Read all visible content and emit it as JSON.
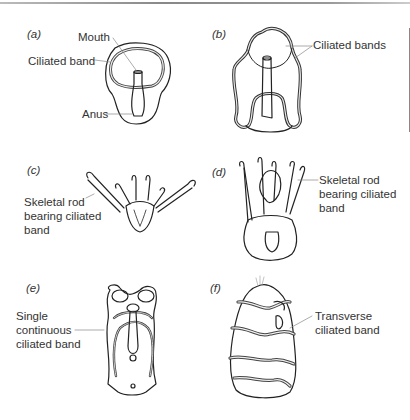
{
  "figure": {
    "panels": [
      {
        "id": "a",
        "label": "(a)",
        "annotations": [
          "Mouth",
          "Ciliated band",
          "Anus"
        ]
      },
      {
        "id": "b",
        "label": "(b)",
        "annotations": [
          "Ciliated bands"
        ]
      },
      {
        "id": "c",
        "label": "(c)",
        "annotations": [
          "Skeletal rod",
          "bearing ciliated",
          "band"
        ]
      },
      {
        "id": "d",
        "label": "(d)",
        "annotations": [
          "Skeletal rod",
          "bearing ciliated",
          "band"
        ]
      },
      {
        "id": "e",
        "label": "(e)",
        "annotations": [
          "Single",
          "continuous",
          "ciliated band"
        ]
      },
      {
        "id": "f",
        "label": "(f)",
        "annotations": [
          "Transverse",
          "ciliated band"
        ]
      }
    ]
  }
}
